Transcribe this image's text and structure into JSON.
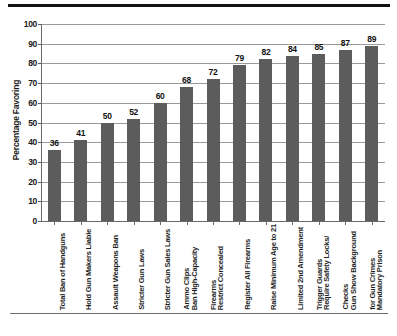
{
  "chart_data": {
    "type": "bar",
    "title": "",
    "subtitle": "",
    "xlabel": "",
    "ylabel": "Percentage Favoring",
    "ylim": [
      0,
      100
    ],
    "ytick_step": 10,
    "yticks": [
      "0",
      "10",
      "20",
      "30",
      "40",
      "50",
      "60",
      "70",
      "80",
      "90",
      "100"
    ],
    "grid": "horizontal",
    "legend": "none",
    "orientation": "vertical",
    "bar_color": "#5c5c5c",
    "gridline_color": "#9a9a9a",
    "axis_color": "#6a6a6a",
    "background_color": "#ffffff",
    "categories": [
      "Total Ban of Handguns",
      "Hold Gun Makers Liable",
      "Assault Weapons Ban",
      "Stricter Gun Laws",
      "Stricter Gun Sales Laws",
      "Ban High-Capacity Ammo Clips",
      "Restrict Concealed Firearms",
      "Register All Firearms",
      "Raise Minimum Age to 21",
      "Limited 2nd Amendment",
      "Require Safety Locks/ Trigger Guards",
      "Gun Show Background Checks",
      "Mandatory Prison for Gun Crimes"
    ],
    "category_lines": [
      [
        "Total Ban of Handguns"
      ],
      [
        "Hold Gun Makers Liable"
      ],
      [
        "Assault Weapons Ban"
      ],
      [
        "Stricter Gun Laws"
      ],
      [
        "Stricter Gun Sales Laws"
      ],
      [
        "Ban High-Capacity",
        "Ammo Clips"
      ],
      [
        "Restrict Concealed",
        "Firearms"
      ],
      [
        "Register All Firearms"
      ],
      [
        "Raise Minimum Age to 21"
      ],
      [
        "Limited 2nd Amendment"
      ],
      [
        "Require Safety Locks/",
        "Trigger Guards"
      ],
      [
        "Gun Show Background",
        "Checks"
      ],
      [
        "Mandatory Prison",
        "for Gun Crimes"
      ]
    ],
    "values": [
      36,
      41,
      50,
      52,
      60,
      68,
      72,
      79,
      82,
      84,
      85,
      87,
      89
    ],
    "value_labels": [
      "36",
      "41",
      "50",
      "52",
      "60",
      "68",
      "72",
      "79",
      "82",
      "84",
      "85",
      "87",
      "89"
    ]
  }
}
